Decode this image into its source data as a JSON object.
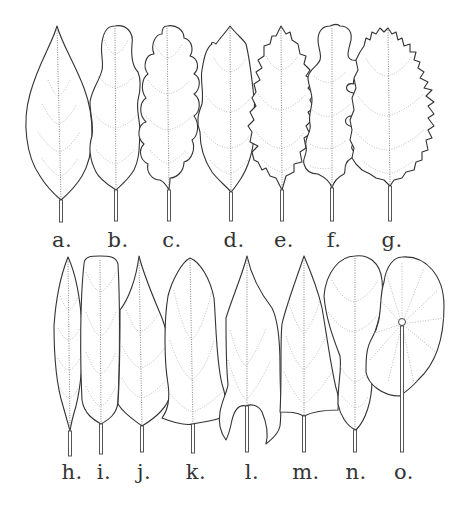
{
  "figure": {
    "type": "botanical line illustration",
    "rows": [
      {
        "leaves": [
          {
            "label": "a.",
            "shape": "ovate-acuminate, entire margin"
          },
          {
            "label": "b.",
            "shape": "sinuate with rounded apical lobe"
          },
          {
            "label": "c.",
            "shape": "crenate / scalloped"
          },
          {
            "label": "d.",
            "shape": "sparsely toothed"
          },
          {
            "label": "e.",
            "shape": "dentate / serrate"
          },
          {
            "label": "f.",
            "shape": "lobed with rounded sinuses"
          },
          {
            "label": "g.",
            "shape": "finely serrate / doubly serrate"
          }
        ]
      },
      {
        "leaves": [
          {
            "label": "h.",
            "shape": "linear-lanceolate"
          },
          {
            "label": "i.",
            "shape": "oblong"
          },
          {
            "label": "j.",
            "shape": "lanceolate-acuminate"
          },
          {
            "label": "k.",
            "shape": "truncate / broad-based"
          },
          {
            "label": "l.",
            "shape": "sagittate / cordate with basal lobes"
          },
          {
            "label": "m.",
            "shape": "deltoid / triangular"
          },
          {
            "label": "n.",
            "shape": "spatulate / panduriform"
          },
          {
            "label": "o.",
            "shape": "peltate (orbicular with central petiole)"
          }
        ]
      }
    ]
  }
}
